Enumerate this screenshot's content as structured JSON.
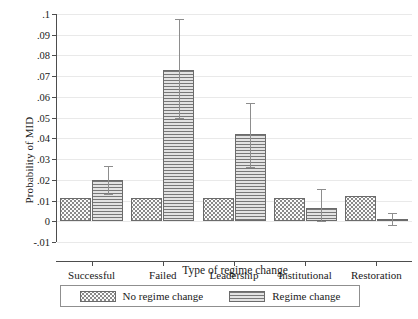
{
  "chart_data": {
    "type": "bar",
    "title": "",
    "xlabel": "Type of regime change",
    "ylabel": "Probability of MID",
    "categories": [
      "Successful",
      "Failed",
      "Leadership",
      "Institutional",
      "Restoration"
    ],
    "ylim": [
      -0.01,
      0.1
    ],
    "ytick_values": [
      -0.01,
      0,
      0.01,
      0.02,
      0.03,
      0.04,
      0.05,
      0.06,
      0.07,
      0.08,
      0.09,
      0.1
    ],
    "ytick_labels": [
      "-.01",
      "0",
      ".01",
      ".02",
      ".03",
      ".04",
      ".05",
      ".06",
      ".07",
      ".08",
      ".09",
      ".1"
    ],
    "grid": true,
    "legend_position": "bottom",
    "series": [
      {
        "name": "No regime change",
        "pattern": "dots",
        "values": [
          0.0113,
          0.0113,
          0.0113,
          0.0113,
          0.0122
        ],
        "error_low": [
          null,
          null,
          null,
          null,
          null
        ],
        "error_high": [
          null,
          null,
          null,
          null,
          null
        ]
      },
      {
        "name": "Regime change",
        "pattern": "horizontal-lines",
        "values": [
          0.02,
          0.073,
          0.042,
          0.0065,
          0.001
        ],
        "error_low": [
          0.0131,
          0.05,
          0.0262,
          0.0,
          -0.002
        ],
        "error_high": [
          0.0268,
          0.0975,
          0.0572,
          0.0155,
          0.0042
        ]
      }
    ]
  },
  "legend": {
    "items": [
      {
        "label": "No regime change"
      },
      {
        "label": "Regime change"
      }
    ]
  },
  "colors": {
    "axis": "#4d4d4d",
    "grid": "#e9e9e9",
    "bar_outline": "#6b6b6b",
    "error_bar": "#8d8d8d",
    "series_no_regime_change": "#fcfcfc",
    "series_regime_change": "#e3e3e3"
  }
}
